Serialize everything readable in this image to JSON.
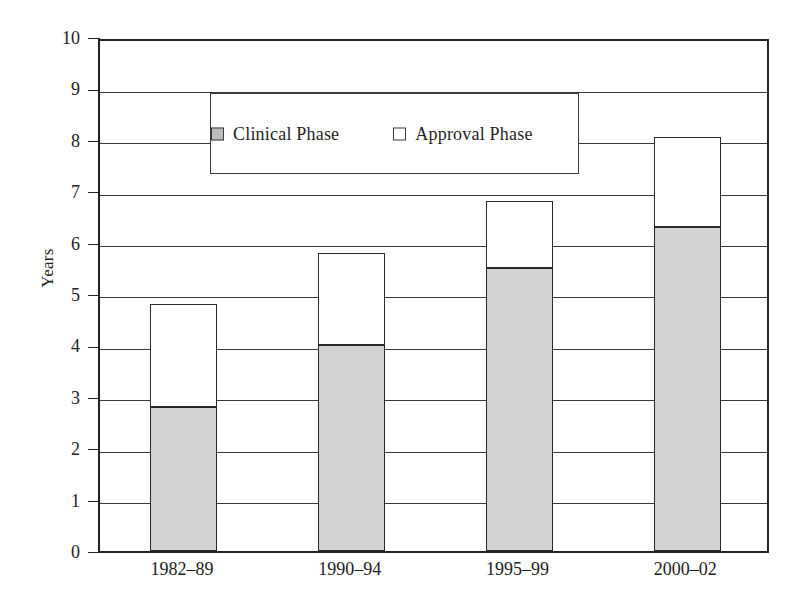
{
  "chart_data": {
    "type": "bar",
    "subtype": "stacked-vertical",
    "title": "",
    "xlabel": "",
    "ylabel": "Years",
    "categories": [
      "1982–89",
      "1990–94",
      "1995–99",
      "2000–02"
    ],
    "series": [
      {
        "name": "Clinical Phase",
        "values": [
          2.8,
          4.0,
          5.5,
          6.3
        ]
      },
      {
        "name": "Approval Phase",
        "values": [
          2.0,
          1.8,
          1.3,
          1.75
        ]
      }
    ],
    "totals": [
      4.8,
      5.8,
      6.8,
      8.05
    ],
    "ylim": [
      0,
      10
    ],
    "yticks": [
      0,
      1,
      2,
      3,
      4,
      5,
      6,
      7,
      8,
      9,
      10
    ],
    "ytick_labels": [
      "0",
      "1",
      "2",
      "3",
      "4",
      "5",
      "6",
      "7",
      "8",
      "9",
      "10"
    ],
    "grid": "horizontal",
    "legend_position": "top-left-inside",
    "colors": {
      "clinical_phase": "#d2d2d2",
      "approval_phase": "#ffffff",
      "axis": "#222222",
      "gridline": "#3a3a3a"
    }
  },
  "legend": {
    "items": [
      {
        "label": "Clinical Phase",
        "swatch": "filled-gray-square"
      },
      {
        "label": "Approval Phase",
        "swatch": "empty-white-square"
      }
    ]
  },
  "axis": {
    "y_title": "Years",
    "y_labels": [
      "10",
      "9",
      "8",
      "7",
      "6",
      "5",
      "4",
      "3",
      "2",
      "1",
      "0"
    ],
    "x_labels": [
      "1982–89",
      "1990–94",
      "1995–99",
      "2000–02"
    ]
  }
}
